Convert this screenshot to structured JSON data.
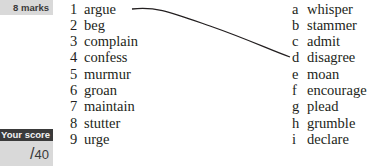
{
  "marks_label": "8 marks",
  "score": {
    "label": "Your score",
    "slash": "/",
    "total": "40"
  },
  "left_items": [
    {
      "num": "1",
      "word": "argue"
    },
    {
      "num": "2",
      "word": "beg"
    },
    {
      "num": "3",
      "word": "complain"
    },
    {
      "num": "4",
      "word": "confess"
    },
    {
      "num": "5",
      "word": "murmur"
    },
    {
      "num": "6",
      "word": "groan"
    },
    {
      "num": "7",
      "word": "maintain"
    },
    {
      "num": "8",
      "word": "stutter"
    },
    {
      "num": "9",
      "word": "urge"
    }
  ],
  "right_items": [
    {
      "letter": "a",
      "word": "whisper"
    },
    {
      "letter": "b",
      "word": "stammer"
    },
    {
      "letter": "c",
      "word": "admit"
    },
    {
      "letter": "d",
      "word": "disagree"
    },
    {
      "letter": "e",
      "word": "moan"
    },
    {
      "letter": "f",
      "word": "encourage"
    },
    {
      "letter": "g",
      "word": "plead"
    },
    {
      "letter": "h",
      "word": "grumble"
    },
    {
      "letter": "i",
      "word": "declare"
    }
  ],
  "example_match": {
    "from": "1",
    "to": "d"
  },
  "colors": {
    "panel_gray": "#d9d9d9",
    "score_header": "#3a3a3a",
    "text": "#231f20"
  }
}
